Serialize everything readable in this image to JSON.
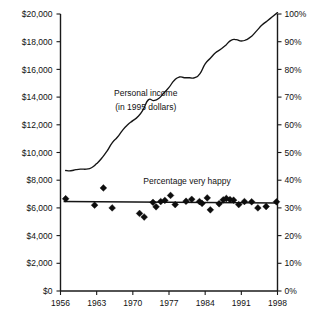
{
  "chart_data": {
    "type": "line",
    "title": "",
    "subtitle": "",
    "xlabel": "",
    "ylabel": "",
    "grid": false,
    "legend_position": "inline-annotations",
    "x_axis": {
      "ticks": [
        1956,
        1963,
        1970,
        1977,
        1984,
        1991,
        1998
      ],
      "tick_labels": [
        "1956",
        "1963",
        "1970",
        "1977",
        "1984",
        "1991",
        "1998"
      ],
      "xlim": [
        1956,
        1998
      ]
    },
    "y_axis_left": {
      "label": "",
      "ticks": [
        0,
        2000,
        4000,
        6000,
        8000,
        10000,
        12000,
        14000,
        16000,
        18000,
        20000
      ],
      "tick_labels": [
        "$0",
        "$2,000",
        "$4,000",
        "$6,000",
        "$8,000",
        "$10,000",
        "$12,000",
        "$14,000",
        "$16,000",
        "$18,000",
        "$20,000"
      ],
      "ylim": [
        0,
        20000
      ]
    },
    "y_axis_right": {
      "label": "",
      "ticks": [
        0,
        10,
        20,
        30,
        40,
        50,
        60,
        70,
        80,
        90,
        100
      ],
      "tick_labels": [
        "0%",
        "10%",
        "20%",
        "30%",
        "40%",
        "50%",
        "60%",
        "70%",
        "80%",
        "90%",
        "100%"
      ],
      "ylim": [
        0,
        100
      ]
    },
    "annotations": [
      {
        "name": "personal-income-label-line1",
        "text": "Personal income",
        "x": 1972.5,
        "y": 14100
      },
      {
        "name": "personal-income-label-line2",
        "text": "(in 1995 dollars)",
        "x": 1972.5,
        "y": 13100
      },
      {
        "name": "percentage-very-happy-label",
        "text": "Percentage very happy",
        "x": 1980.5,
        "y": 7750
      }
    ],
    "series": [
      {
        "name": "Personal income (in 1995 dollars)",
        "type": "line",
        "axis": "left",
        "unit": "1995 dollars",
        "x": [
          1957,
          1958,
          1959,
          1960,
          1961,
          1962,
          1963,
          1964,
          1965,
          1966,
          1967,
          1968,
          1969,
          1970,
          1971,
          1972,
          1973,
          1974,
          1975,
          1976,
          1977,
          1978,
          1979,
          1980,
          1981,
          1982,
          1983,
          1984,
          1985,
          1986,
          1987,
          1988,
          1989,
          1990,
          1991,
          1992,
          1993,
          1994,
          1995,
          1996,
          1997,
          1998
        ],
        "values": [
          8700,
          8680,
          8760,
          8800,
          8800,
          8900,
          9200,
          9600,
          10100,
          10700,
          11100,
          11600,
          12000,
          12300,
          12600,
          13100,
          13800,
          13750,
          13900,
          14300,
          14700,
          15200,
          15450,
          15400,
          15400,
          15400,
          15700,
          16400,
          16800,
          17200,
          17450,
          17750,
          18100,
          18150,
          18050,
          18150,
          18400,
          18800,
          19200,
          19500,
          19800,
          20100
        ]
      },
      {
        "name": "Percentage very happy",
        "type": "scatter",
        "axis": "right",
        "unit": "percent",
        "points": [
          {
            "x": 1957,
            "y": 33.3
          },
          {
            "x": 1962.6,
            "y": 31.0
          },
          {
            "x": 1964.3,
            "y": 37.2
          },
          {
            "x": 1966.0,
            "y": 30.0
          },
          {
            "x": 1971.3,
            "y": 28.0
          },
          {
            "x": 1972.2,
            "y": 26.7
          },
          {
            "x": 1973.9,
            "y": 32.0
          },
          {
            "x": 1974.5,
            "y": 30.4
          },
          {
            "x": 1975.4,
            "y": 32.3
          },
          {
            "x": 1976.2,
            "y": 32.7
          },
          {
            "x": 1977.3,
            "y": 34.5
          },
          {
            "x": 1978.2,
            "y": 31.2
          },
          {
            "x": 1980.3,
            "y": 32.4
          },
          {
            "x": 1981.4,
            "y": 33.1
          },
          {
            "x": 1982.9,
            "y": 32.3
          },
          {
            "x": 1983.4,
            "y": 31.6
          },
          {
            "x": 1984.4,
            "y": 33.6
          },
          {
            "x": 1985.0,
            "y": 29.3
          },
          {
            "x": 1986.7,
            "y": 31.5
          },
          {
            "x": 1987.5,
            "y": 32.9
          },
          {
            "x": 1988.1,
            "y": 33.4
          },
          {
            "x": 1988.8,
            "y": 33.0
          },
          {
            "x": 1989.5,
            "y": 32.8
          },
          {
            "x": 1990.5,
            "y": 31.2
          },
          {
            "x": 1991.6,
            "y": 32.3
          },
          {
            "x": 1993.0,
            "y": 32.2
          },
          {
            "x": 1994.2,
            "y": 30.0
          },
          {
            "x": 1995.8,
            "y": 30.5
          },
          {
            "x": 1997.8,
            "y": 32.2
          }
        ],
        "trend": {
          "name": "happiness-trend-line",
          "x_start": 1956.6,
          "y_start": 32.3,
          "x_end": 1998.0,
          "y_end": 31.8
        }
      }
    ]
  }
}
